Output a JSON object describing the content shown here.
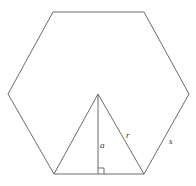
{
  "diagram": {
    "colors": {
      "stroke": "#6b6b6b",
      "label": "#333333",
      "background": "#ffffff"
    },
    "hexagon": {
      "vertices": [
        [
          53,
          12
        ],
        [
          144,
          12
        ],
        [
          189,
          94
        ],
        [
          144,
          174
        ],
        [
          54,
          174
        ],
        [
          8,
          94
        ]
      ]
    },
    "center": [
      98,
      94
    ],
    "triangle": {
      "apex": [
        98,
        94
      ],
      "base_left": [
        54,
        174
      ],
      "base_right": [
        144,
        174
      ]
    },
    "apothem_foot": [
      98,
      174
    ],
    "right_angle_marker": {
      "x": 99,
      "y": 168,
      "size": 6
    },
    "labels": {
      "apothem": "a",
      "radius": "r",
      "side": "s"
    }
  }
}
